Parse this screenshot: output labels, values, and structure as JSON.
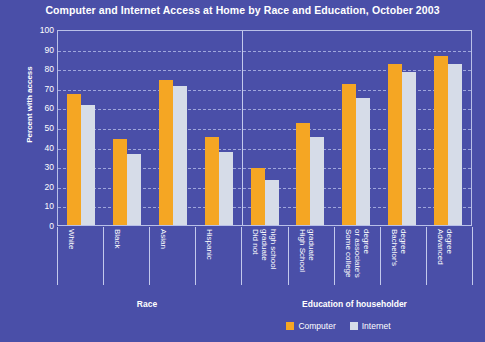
{
  "chart_data": {
    "type": "bar",
    "title": "Computer and Internet Access at Home by Race and Education, October 2003",
    "xlabel": "",
    "ylabel": "Percent with access",
    "ylim": [
      0,
      100
    ],
    "ytick_step": 10,
    "yticks": [
      100,
      90,
      80,
      70,
      60,
      50,
      40,
      30,
      20,
      10,
      0
    ],
    "grid": true,
    "legend_position": "bottom-right",
    "categories": [
      "White",
      "Black",
      "Asian",
      "Hispanic",
      "Did not graduate high school",
      "High School graduate",
      "Some college or associate's degree",
      "Bachelor's degree",
      "Advanced degree"
    ],
    "category_label_lines": [
      [
        "White"
      ],
      [
        "Black"
      ],
      [
        "Asian"
      ],
      [
        "Hispanic"
      ],
      [
        "Did not",
        "graduate",
        "high school"
      ],
      [
        "High School",
        "graduate"
      ],
      [
        "Some college",
        "or associate's",
        "degree"
      ],
      [
        "Bachelor's",
        "degree"
      ],
      [
        "Advanced",
        "degree"
      ]
    ],
    "series": [
      {
        "name": "Computer",
        "color": "#f5a623",
        "values": [
          67,
          44,
          74,
          45,
          29,
          52,
          72,
          82,
          86
        ]
      },
      {
        "name": "Internet",
        "color": "#d6dce8",
        "values": [
          61,
          36,
          71,
          37,
          23,
          45,
          65,
          78,
          82
        ]
      }
    ],
    "groups": [
      {
        "label": "Race",
        "categories": [
          "White",
          "Black",
          "Asian",
          "Hispanic"
        ]
      },
      {
        "label": "Education of householder",
        "categories": [
          "Did not graduate high school",
          "High School graduate",
          "Some college or associate's degree",
          "Bachelor's degree",
          "Advanced degree"
        ]
      }
    ],
    "background_color": "#4a4fa8",
    "text_color": "#ffffff",
    "gridline_color": "#aeb6e6"
  }
}
